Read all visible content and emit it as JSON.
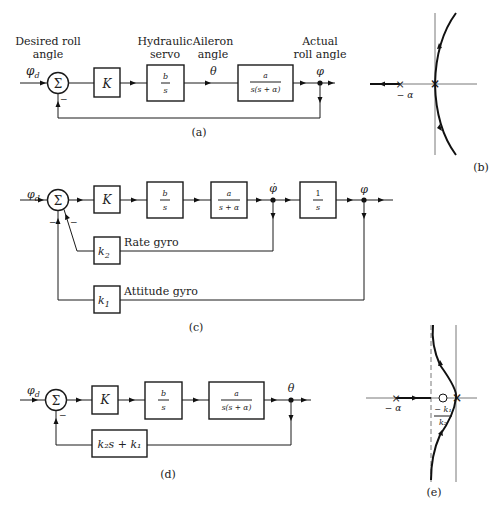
{
  "diagram_a": {
    "caption": "(a)",
    "input_symbol": "φ",
    "input_sub": "d",
    "input_label_line1": "Desired roll",
    "input_label_line2": "angle",
    "sum_symbol": "Σ",
    "sum_sign": "−",
    "gain_block": "K",
    "servo_label_line1": "Hydraulic",
    "servo_label_line2": "servo",
    "servo_num": "b",
    "servo_den": "s",
    "aileron_label_line1": "Aileron",
    "aileron_label_line2": "angle",
    "aileron_symbol": "θ",
    "plant_num": "a",
    "plant_den": "s(s + α)",
    "output_label_line1": "Actual",
    "output_label_line2": "roll angle",
    "output_symbol": "φ"
  },
  "diagram_b": {
    "caption": "(b)",
    "pole_label": "− α"
  },
  "diagram_c": {
    "caption": "(c)",
    "input_symbol": "φ",
    "input_sub": "d",
    "sum_symbol": "Σ",
    "sum_sign_left": "−",
    "sum_sign_right": "−",
    "gain_block": "K",
    "servo_num": "b",
    "servo_den": "s",
    "plant_num": "a",
    "plant_den": "s + α",
    "rate_symbol": "φ̇",
    "integrator_num": "1",
    "integrator_den": "s",
    "output_symbol": "φ",
    "rate_gain": "k",
    "rate_gain_sub": "2",
    "rate_label": "Rate gyro",
    "attitude_gain": "k",
    "attitude_gain_sub": "1",
    "attitude_label": "Attitude gyro"
  },
  "diagram_d": {
    "caption": "(d)",
    "input_symbol": "φ",
    "input_sub": "d",
    "sum_symbol": "Σ",
    "sum_sign": "−",
    "gain_block": "K",
    "servo_num": "b",
    "servo_den": "s",
    "plant_num": "a",
    "plant_den": "s(s + α)",
    "output_symbol": "θ",
    "feedback_block": "k₂s + k₁"
  },
  "diagram_e": {
    "caption": "(e)",
    "pole_label": "− α",
    "zero_label_num": "− k₁",
    "zero_label_den": "k₂"
  }
}
